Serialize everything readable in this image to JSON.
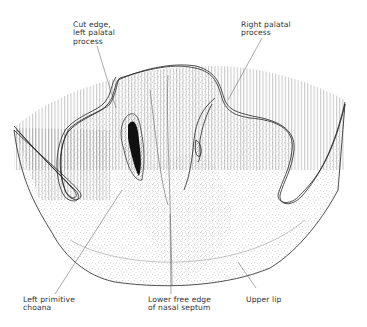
{
  "figure": {
    "colors": {
      "ink": "#222222",
      "hatch": "#9a9a9a",
      "stipple": "#555555",
      "background": "#ffffff",
      "choana": "#111111"
    }
  },
  "labels": {
    "cut_edge": "Cut edge,\nleft palatal\nprocess",
    "right_palatal": "Right palatal\nprocess",
    "left_choana": "Left primitive\nchoana",
    "septum": "Lower free edge\nof nasal septum",
    "upper_lip": "Upper lip"
  }
}
